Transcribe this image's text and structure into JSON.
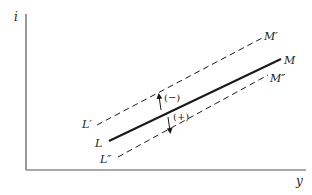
{
  "diagram": {
    "axes": {
      "y_label": "i",
      "x_label": "y"
    },
    "curves": [
      {
        "id": "LM",
        "start_label": "L",
        "end_label": "M",
        "style": "solid"
      },
      {
        "id": "L1M1",
        "start_label": "L′",
        "end_label": "M′",
        "style": "dashed"
      },
      {
        "id": "L2M2",
        "start_label": "L″",
        "end_label": "M″",
        "style": "dashed"
      }
    ],
    "shifts": [
      {
        "label": "(−)",
        "direction": "up",
        "to": "L′M′"
      },
      {
        "label": "(+)",
        "direction": "down",
        "to": "L″M″"
      }
    ],
    "colors": {
      "ink": "#1a1a1a",
      "axis": "#555555",
      "background": "#ffffff"
    }
  }
}
